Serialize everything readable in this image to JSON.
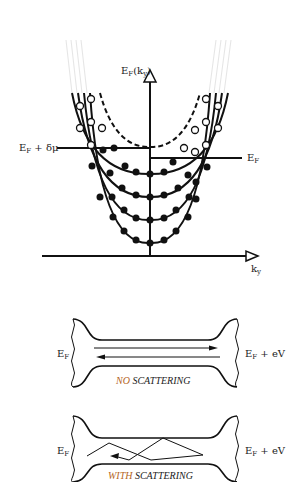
{
  "top_diagram": {
    "y_axis_label": "E",
    "y_axis_label_sub": "F",
    "y_axis_label_arg": "(k",
    "y_axis_label_arg_sub": "y",
    "y_axis_label_close": ")",
    "x_axis_label": "k",
    "x_axis_label_sub": "y",
    "left_level_label": "E",
    "left_level_label_sub": "F",
    "left_level_label_suffix": " + δμ",
    "right_level_label": "E",
    "right_level_label_sub": "F"
  },
  "panel_no_scattering": {
    "left_label": "E",
    "left_label_sub": "F",
    "right_label": "E",
    "right_label_sub": "F",
    "right_label_suffix": " + eV",
    "caption_accent": "NO",
    "caption_rest": " SCATTERING"
  },
  "panel_with_scattering": {
    "left_label": "E",
    "left_label_sub": "F",
    "right_label": "E",
    "right_label_sub": "F",
    "right_label_suffix": " + eV",
    "caption_accent": "WITH",
    "caption_rest": " SCATTERING"
  },
  "colors": {
    "ink": "#111111",
    "accent": "#b5651d"
  }
}
